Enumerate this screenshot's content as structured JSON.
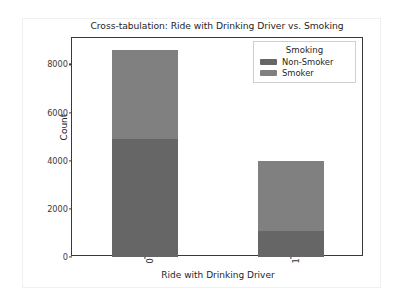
{
  "chart_data": {
    "type": "bar",
    "subtype": "stacked-bar",
    "title": "Cross-tabulation: Ride with Drinking Driver vs. Smoking",
    "xlabel": "Ride with Drinking Driver",
    "ylabel": "Count",
    "categories": [
      "0",
      "1"
    ],
    "series": [
      {
        "name": "Non-Smoker",
        "values": [
          4900,
          1070
        ],
        "color": "#666666"
      },
      {
        "name": "Smoker",
        "values": [
          3700,
          2930
        ],
        "color": "#808080"
      }
    ],
    "totals": [
      8600,
      4000
    ],
    "ylim": [
      0,
      9100
    ],
    "yticks": [
      0,
      2000,
      4000,
      6000,
      8000
    ],
    "ytick_labels": [
      "0",
      "2000",
      "4000",
      "6000",
      "8000"
    ],
    "xtick_labels": [
      "0",
      "1"
    ],
    "xtick_rotation": 90,
    "grid": false,
    "legend": {
      "title": "Smoking",
      "position": "upper right",
      "entries": [
        "Non-Smoker",
        "Smoker"
      ]
    },
    "background_color": "#ffffff",
    "axis_color": "#3a3a3a",
    "text_color": "#262626"
  }
}
